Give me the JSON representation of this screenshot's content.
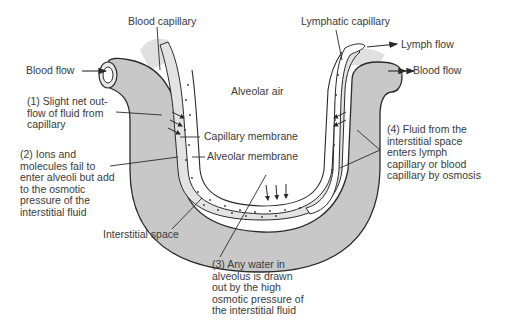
{
  "diagram": {
    "labels": {
      "blood_capillary": "Blood capillary",
      "lymphatic_capillary": "Lymphatic capillary",
      "lymph_flow": "Lymph flow",
      "blood_flow_left": "Blood flow",
      "blood_flow_right": "Blood flow",
      "alveolar_air": "Alveolar air",
      "capillary_membrane": "Capillary membrane",
      "alveolar_membrane": "Alveolar membrane",
      "interstitial_space": "Interstitial space"
    },
    "steps": [
      {
        "id": 1,
        "text": "(1) Slight net out-\nflow of fluid from\ncapillary"
      },
      {
        "id": 2,
        "text": "(2) Ions and\nmolecules fail to\nenter alveoli but add\nto the osmotic\npressure of the\ninterstitial fluid"
      },
      {
        "id": 3,
        "text": "(3) Any water in\nalveolus is drawn\nout by the high\nosmotic pressure of\nthe interstitial fluid"
      },
      {
        "id": 4,
        "text": "(4) Fluid from the\ninterstitial space\nenters lymph\ncapillary or blood\ncapillary by osmosis"
      }
    ],
    "colors": {
      "capillary_fill": "#c8c8c8",
      "interstitial_fill": "#e3e3e3",
      "outline": "#2a2a2a",
      "text": "#3a3a3a"
    }
  }
}
